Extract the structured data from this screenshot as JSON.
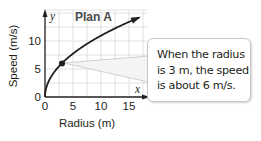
{
  "chart_data": {
    "type": "line",
    "title": "Plan A",
    "xlabel": "Radius (m)",
    "ylabel": "Speed (m/s)",
    "x_axis_var": "x",
    "y_axis_var": "y",
    "x_ticks": [
      "0",
      "5",
      "10",
      "15"
    ],
    "y_ticks": [
      "0",
      "5",
      "10"
    ],
    "xlim": [
      0,
      18
    ],
    "ylim": [
      0,
      15.5
    ],
    "grid": true,
    "grid_step": 2.5,
    "series": [
      {
        "name": "Plan A",
        "function": "y = sqrt(12x)",
        "x": [
          0,
          0.5,
          1,
          2,
          3,
          4,
          5,
          6,
          8,
          10,
          12,
          14,
          15,
          17
        ],
        "y": [
          0,
          2.45,
          3.46,
          4.9,
          6,
          6.93,
          7.75,
          8.49,
          9.8,
          10.95,
          12,
          12.96,
          13.42,
          14.28
        ]
      }
    ],
    "highlight_point": {
      "x": 3,
      "y": 6
    },
    "annotation": "When the radius is 3 m, the speed is about 6 m/s."
  },
  "labels": {
    "title": "Plan A",
    "x_var": "x",
    "y_var": "y",
    "xlabel": "Radius (m)",
    "ylabel": "Speed (m/s)",
    "x_ticks": [
      "0",
      "5",
      "10",
      "15"
    ],
    "y_ticks": [
      "0",
      "5",
      "10"
    ]
  },
  "callout": {
    "lines": [
      "When the radius",
      "is 3 m, the speed",
      "is about 6 m/s."
    ]
  },
  "colors": {
    "curve": "#231f20",
    "grid": "#d9d9d9",
    "axis": "#231f20",
    "callout_border": "#c8c8c8",
    "leader": "#bdbdbd"
  }
}
